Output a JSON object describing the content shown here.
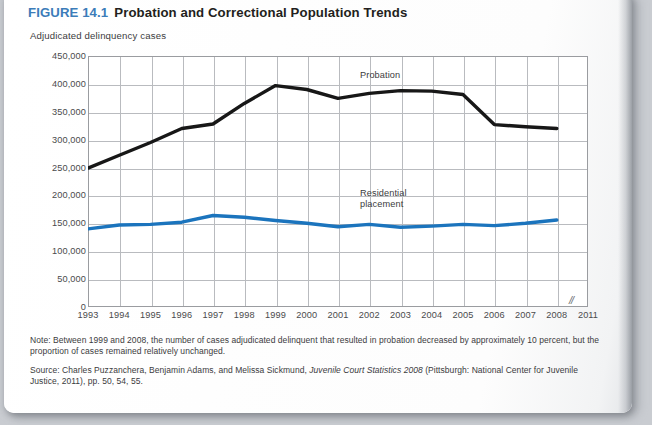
{
  "figure": {
    "number": "FIGURE 14.1",
    "title": "Probation and Correctional Population Trends",
    "subtitle": "Adjudicated delinquency cases",
    "axis_break_symbol": "//"
  },
  "note": {
    "text": "Note: Between 1999 and 2008, the number of cases adjudicated delinquent that resulted in probation decreased by approximately 10 percent, but the proportion of cases remained relatively unchanged."
  },
  "source": {
    "prefix": "Source: Charles Puzzanchera, Benjamin Adams, and Melissa Sickmund, ",
    "italic_title": "Juvenile Court Statistics 2008",
    "suffix": " (Pittsburgh: National Center for Juvenile Justice, 2011), pp. 50, 54, 55."
  },
  "colors": {
    "figure_number": "#3c7cb9",
    "probation_line": "#171717",
    "residential_line": "#1b74bd",
    "grid": "#b9bbbf",
    "axis": "#9a9ca0"
  },
  "chart_data": {
    "type": "line",
    "title": "Probation and Correctional Population Trends",
    "subtitle": "Adjudicated delinquency cases",
    "xlabel": "",
    "ylabel": "Adjudicated delinquency cases",
    "ylim": [
      0,
      450000
    ],
    "ytick_labels": [
      "450,000",
      "400,000",
      "350,000",
      "300,000",
      "250,000",
      "200,000",
      "150,000",
      "100,000",
      "50,000",
      "0"
    ],
    "ytick_values": [
      450000,
      400000,
      350000,
      300000,
      250000,
      200000,
      150000,
      100000,
      50000,
      0
    ],
    "categories": [
      "1993",
      "1994",
      "1995",
      "1996",
      "1997",
      "1998",
      "1999",
      "2000",
      "2001",
      "2002",
      "2003",
      "2004",
      "2005",
      "2006",
      "2007",
      "2008",
      "2011"
    ],
    "x_axis_break_after": "2008",
    "grid": true,
    "legend": "inline-labels",
    "series": [
      {
        "name": "Probation",
        "color": "#171717",
        "x": [
          "1993",
          "1994",
          "1995",
          "1996",
          "1997",
          "1998",
          "1999",
          "2000",
          "2001",
          "2002",
          "2003",
          "2004",
          "2005",
          "2006",
          "2007",
          "2008"
        ],
        "values": [
          249000,
          272000,
          295000,
          320000,
          328000,
          365000,
          397000,
          390000,
          374000,
          383000,
          388000,
          387000,
          381000,
          327000,
          323000,
          320000
        ]
      },
      {
        "name": "Residential placement",
        "color": "#1b74bd",
        "x": [
          "1993",
          "1994",
          "1995",
          "1996",
          "1997",
          "1998",
          "1999",
          "2000",
          "2001",
          "2002",
          "2003",
          "2004",
          "2005",
          "2006",
          "2007",
          "2008"
        ],
        "values": [
          140000,
          147000,
          148000,
          152000,
          164000,
          161000,
          155000,
          150000,
          144000,
          148000,
          143000,
          145000,
          148000,
          146000,
          150000,
          156000
        ]
      }
    ],
    "annotations": [
      {
        "text": "Probation",
        "near": "1999-2000 upper curve"
      },
      {
        "text": "Residential placement",
        "near": "2001-2002 lower curve"
      }
    ]
  }
}
